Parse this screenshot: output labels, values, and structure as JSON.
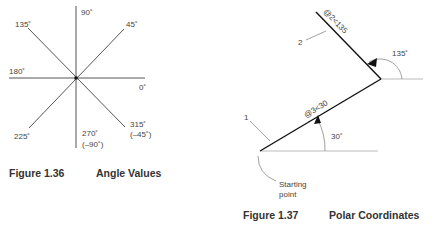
{
  "figure_1_36": {
    "number": "Figure 1.36",
    "title": "Angle Values",
    "angle_labels": {
      "a0": "0˚",
      "a45": "45˚",
      "a90": "90˚",
      "a135": "135˚",
      "a180": "180˚",
      "a225": "225˚",
      "a270": "270˚",
      "a270_alt": "(–90˚)",
      "a315": "315˚",
      "a315_alt": "(–45˚)"
    }
  },
  "figure_1_37": {
    "number": "Figure 1.37",
    "title": "Polar Coordinates",
    "segment_1_label": "1",
    "segment_2_label": "2",
    "segment_1_coord": "@3<30",
    "segment_2_coord": "@2<135",
    "angle_1": "30˚",
    "angle_2": "135˚",
    "start_label_line1": "Starting",
    "start_label_line2": "point"
  }
}
